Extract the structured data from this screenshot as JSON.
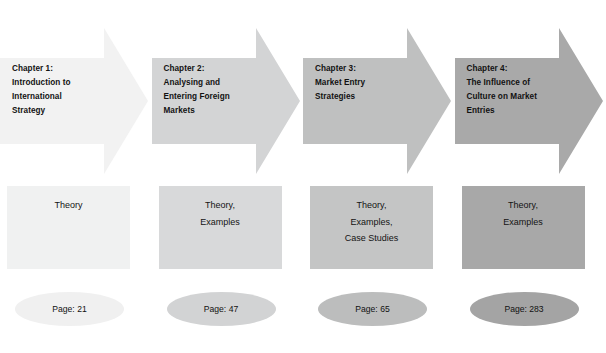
{
  "diagram": {
    "type": "process-flow",
    "columns": [
      {
        "arrow_label": "Chapter 1:\nIntroduction to\nInternational\nStrategy",
        "box_label": "Theory",
        "page_label": "Page: 21",
        "arrow_color": "#f2f2f2",
        "box_color": "#f0f1f1",
        "ellipse_color": "#f0f0f0"
      },
      {
        "arrow_label": "Chapter 2:\nAnalysing and\nEntering Foreign\nMarkets",
        "box_label": "Theory,\nExamples",
        "page_label": "Page: 47",
        "arrow_color": "#d3d4d5",
        "box_color": "#d8d9da",
        "ellipse_color": "#d2d3d4"
      },
      {
        "arrow_label": "Chapter 3:\nMarket Entry\nStrategies",
        "box_label": "Theory,\nExamples,\nCase Studies",
        "page_label": "Page: 65",
        "arrow_color": "#bfc0c0",
        "box_color": "#c4c5c5",
        "ellipse_color": "#bcbdbd"
      },
      {
        "arrow_label": "Chapter 4:\nThe Influence of\nCulture on Market\nEntries",
        "box_label": "Theory,\nExamples",
        "page_label": "Page: 283",
        "arrow_color": "#a9a9a9",
        "box_color": "#a8a8a8",
        "ellipse_color": "#a4a4a4"
      }
    ]
  }
}
